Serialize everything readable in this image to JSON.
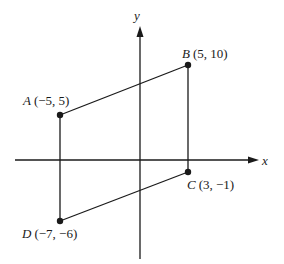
{
  "diagram": {
    "type": "coordinate-plane-quadrilateral",
    "axes": {
      "x_label": "x",
      "y_label": "y"
    },
    "points": [
      {
        "name": "A",
        "coords": "(−5, 5)",
        "x": -5,
        "y": 5
      },
      {
        "name": "B",
        "coords": "(5, 10)",
        "x": 5,
        "y": 10
      },
      {
        "name": "C",
        "coords": "(3, −1)",
        "x": 3,
        "y": -1
      },
      {
        "name": "D",
        "coords": "(−7, −6)",
        "x": -7,
        "y": -6
      }
    ],
    "segments": [
      "AB",
      "BC",
      "CD",
      "DA"
    ],
    "colors": {
      "stroke": "#1a1a1a",
      "background": "#ffffff"
    }
  }
}
